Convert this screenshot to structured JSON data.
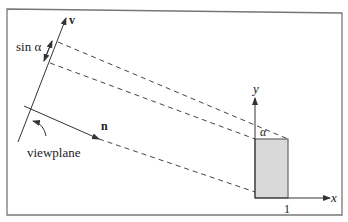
{
  "figure": {
    "labels": {
      "v": "v",
      "sin_alpha": "sin α",
      "n": "n",
      "viewplane": "viewplane",
      "y_axis": "y",
      "x_axis": "x",
      "alpha": "α",
      "unit_tick": "1"
    },
    "colors": {
      "line": "#333333",
      "frame": "#777777",
      "square_fill": "#d9d9d9",
      "square_stroke": "#666666"
    }
  }
}
